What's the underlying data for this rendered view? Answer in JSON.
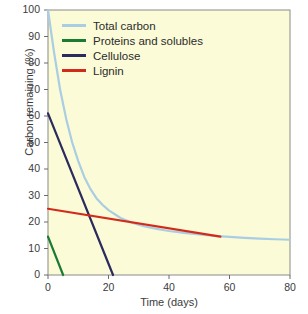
{
  "chart_data": {
    "type": "line",
    "title": "",
    "xlabel": "Time (days)",
    "ylabel": "Carbon remaining (%)",
    "xlim": [
      0,
      80
    ],
    "ylim": [
      0,
      100
    ],
    "xticks": [
      0,
      20,
      40,
      60,
      80
    ],
    "yticks": [
      0,
      10,
      20,
      30,
      40,
      50,
      60,
      70,
      80,
      90,
      100
    ],
    "grid": false,
    "legend_position": "top-left",
    "plot_background": "#fbfbd8",
    "series": [
      {
        "name": "Total carbon",
        "color": "#a9cde3",
        "x": [
          0,
          2,
          4,
          6,
          8,
          10,
          12,
          14,
          16,
          18,
          20,
          24,
          28,
          32,
          36,
          40,
          45,
          50,
          55,
          60,
          65,
          70,
          75,
          80
        ],
        "y": [
          100,
          84,
          70,
          59,
          50,
          43,
          37,
          32.5,
          29,
          26.5,
          24.5,
          21.5,
          19.6,
          18.3,
          17.4,
          16.6,
          15.9,
          15.3,
          14.8,
          14.4,
          14.0,
          13.7,
          13.5,
          13.3
        ]
      },
      {
        "name": "Proteins and solubles",
        "color": "#1b7a33",
        "x": [
          0,
          5
        ],
        "y": [
          14.5,
          0
        ]
      },
      {
        "name": "Cellulose",
        "color": "#2b2b5e",
        "x": [
          0,
          21.5
        ],
        "y": [
          61,
          0
        ]
      },
      {
        "name": "Lignin",
        "color": "#d32b1b",
        "x": [
          0,
          57
        ],
        "y": [
          25,
          14.5
        ]
      }
    ]
  },
  "legend": {
    "items": [
      {
        "label": "Total carbon",
        "color": "#a9cde3"
      },
      {
        "label": "Proteins and solubles",
        "color": "#1b7a33"
      },
      {
        "label": "Cellulose",
        "color": "#2b2b5e"
      },
      {
        "label": "Lignin",
        "color": "#d32b1b"
      }
    ]
  },
  "axes": {
    "y_title": "Carbon remaining (%)",
    "x_title": "Time (days)",
    "ytick_labels": [
      "0",
      "10",
      "20",
      "30",
      "40",
      "50",
      "60",
      "70",
      "80",
      "90",
      "100"
    ],
    "xtick_labels": [
      "0",
      "20",
      "40",
      "60",
      "80"
    ]
  }
}
